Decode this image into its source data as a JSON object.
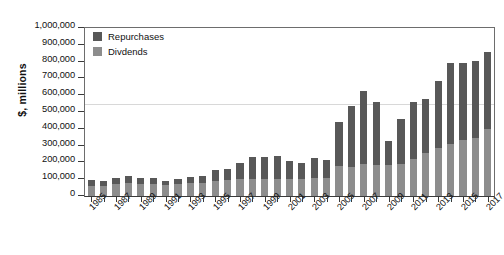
{
  "chart_data": {
    "type": "bar",
    "stacked": true,
    "title": "",
    "xlabel": "",
    "ylabel": "$, millions",
    "ylim": [
      0,
      1000000
    ],
    "ytick_step": 100000,
    "grid": true,
    "legend_position": "top-left",
    "categories": [
      "1985",
      "1986",
      "1987",
      "1988",
      "1989",
      "1990",
      "1991",
      "1992",
      "1993",
      "1994",
      "1995",
      "1996",
      "1997",
      "1998",
      "1999",
      "2000",
      "2001",
      "2002",
      "2003",
      "2004",
      "2005",
      "2006",
      "2007",
      "2008",
      "2009",
      "2010",
      "2011",
      "2012",
      "2013",
      "2014",
      "2015",
      "2016",
      "2017"
    ],
    "xtick_labels": [
      "1985",
      "1987",
      "1989",
      "1991",
      "1993",
      "1995",
      "1997",
      "1999",
      "2001",
      "2003",
      "2005",
      "2007",
      "2009",
      "2011",
      "2013",
      "2015",
      "2017"
    ],
    "ytick_labels": [
      "1,000,000",
      "900,000",
      "800,000",
      "700,000",
      "600,000",
      "500,000",
      "400,000",
      "300,000",
      "200,000",
      "100,000",
      "0"
    ],
    "series": [
      {
        "name": "Divdends",
        "color": "#8d8d8d",
        "values": [
          62000,
          58000,
          70000,
          78000,
          72000,
          70000,
          68000,
          72000,
          75000,
          80000,
          88000,
          95000,
          100000,
          102000,
          100000,
          100000,
          100000,
          100000,
          105000,
          110000,
          180000,
          172000,
          190000,
          182000,
          185000,
          190000,
          222000,
          258000,
          288000,
          310000,
          332000,
          348000,
          400000
        ]
      },
      {
        "name": "Repurchases",
        "color": "#585858",
        "values": [
          33000,
          30000,
          37000,
          42000,
          38000,
          36000,
          24000,
          28000,
          36000,
          38000,
          64000,
          66000,
          96000,
          130000,
          134000,
          140000,
          108000,
          98000,
          120000,
          107000,
          262000,
          364000,
          438000,
          375000,
          140000,
          268000,
          340000,
          322000,
          395000,
          480000,
          458000,
          453000,
          460000
        ]
      }
    ],
    "totals": [
      95000,
      88000,
      107000,
      120000,
      110000,
      106000,
      92000,
      100000,
      111000,
      118000,
      152000,
      161000,
      196000,
      232000,
      234000,
      240000,
      208000,
      198000,
      225000,
      217000,
      442000,
      536000,
      628000,
      557000,
      325000,
      458000,
      562000,
      580000,
      683000,
      790000,
      790000,
      801000,
      860000
    ]
  },
  "legend": {
    "items": [
      {
        "label": "Repurchases",
        "color": "#585858"
      },
      {
        "label": "Divdends",
        "color": "#8d8d8d"
      }
    ]
  },
  "axes": {
    "y_title": "$, millions"
  }
}
